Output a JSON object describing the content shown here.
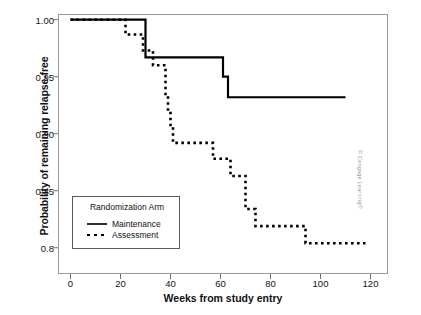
{
  "figure": {
    "credit": "© Cengage Learning®"
  },
  "legend": {
    "title": "Randomization Arm",
    "entries": [
      {
        "label": "Maintenance",
        "style": "solid"
      },
      {
        "label": "Assessment",
        "style": "dotted"
      }
    ]
  },
  "chart_data": {
    "type": "line",
    "subtype": "kaplan-meier-step",
    "title": "",
    "xlabel": "Weeks from study entry",
    "ylabel": "Probability of remaining relapse-free",
    "xlim": [
      -5,
      127
    ],
    "ylim": [
      0.777,
      1.005
    ],
    "xticks": [
      0,
      20,
      40,
      60,
      80,
      100,
      120
    ],
    "xtick_labels": [
      "0",
      "20",
      "40",
      "60",
      "80",
      "100",
      "120"
    ],
    "yticks": [
      1.0,
      0.95,
      0.9,
      0.85,
      0.8
    ],
    "ytick_labels": [
      "1.00",
      "0.95",
      "0.90",
      "0.85",
      "0.8"
    ],
    "grid": false,
    "legend_position": "lower-left-inside",
    "series": [
      {
        "name": "Maintenance",
        "style": "solid",
        "color": "#000000",
        "points": [
          [
            0,
            1.0
          ],
          [
            30,
            1.0
          ],
          [
            30,
            0.967
          ],
          [
            61,
            0.967
          ],
          [
            61,
            0.95
          ],
          [
            63,
            0.95
          ],
          [
            63,
            0.932
          ],
          [
            110,
            0.932
          ]
        ]
      },
      {
        "name": "Assessment",
        "style": "dotted",
        "color": "#000000",
        "points": [
          [
            0,
            1.0
          ],
          [
            22,
            1.0
          ],
          [
            22,
            0.987
          ],
          [
            29,
            0.987
          ],
          [
            29,
            0.973
          ],
          [
            33,
            0.973
          ],
          [
            33,
            0.96
          ],
          [
            38,
            0.96
          ],
          [
            38,
            0.933
          ],
          [
            39,
            0.933
          ],
          [
            39,
            0.92
          ],
          [
            40,
            0.92
          ],
          [
            40,
            0.906
          ],
          [
            41,
            0.906
          ],
          [
            41,
            0.892
          ],
          [
            57,
            0.892
          ],
          [
            57,
            0.878
          ],
          [
            64,
            0.878
          ],
          [
            64,
            0.863
          ],
          [
            70,
            0.863
          ],
          [
            70,
            0.834
          ],
          [
            74,
            0.834
          ],
          [
            74,
            0.819
          ],
          [
            94,
            0.819
          ],
          [
            94,
            0.804
          ],
          [
            118,
            0.804
          ]
        ]
      }
    ]
  }
}
